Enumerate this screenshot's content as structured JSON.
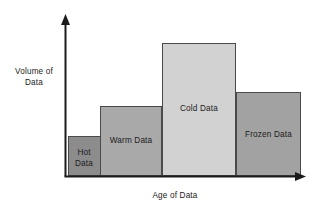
{
  "figure": {
    "background_color": "#ffffff",
    "axis_color": "#1b1b1b",
    "bar_border_color": "#4a4a4a"
  },
  "axes": {
    "y_label": "Volume of\nData",
    "x_label": "Age of Data",
    "y_arrow_icon": "arrow-up-icon",
    "x_arrow_icon": "arrow-right-icon"
  },
  "chart_data": {
    "type": "bar",
    "title": "",
    "subtitle": "",
    "xlabel": "Age of Data",
    "ylabel": "Volume of Data",
    "categories": [
      "Hot Data",
      "Warm Data",
      "Cold Data",
      "Frozen Data"
    ],
    "values": [
      30,
      53,
      100,
      63
    ],
    "bar_widths": [
      32,
      62,
      74,
      65
    ],
    "colors": [
      "#8c8c8c",
      "#a9a9a9",
      "#d2d2d2",
      "#a2a2a2"
    ],
    "grid": false,
    "legend": null,
    "xlim": [
      0,
      237
    ],
    "ylim": [
      0,
      100
    ],
    "tick_labels_x": [],
    "tick_labels_y": [],
    "annotations": [
      {
        "text": "Hot Data",
        "category": "Hot Data"
      },
      {
        "text": "Warm Data",
        "category": "Warm Data"
      },
      {
        "text": "Cold Data",
        "category": "Cold Data"
      },
      {
        "text": "Frozen Data",
        "category": "Frozen Data"
      }
    ]
  },
  "bars": [
    {
      "id": "hot-data",
      "label": "Hot\nData",
      "fill": "#8c8c8c",
      "x": 68,
      "y": 136,
      "width": 32,
      "height": 40,
      "label_left": 68,
      "label_top": 148,
      "label_width": 32
    },
    {
      "id": "warm-data",
      "label": "Warm Data",
      "fill": "#a9a9a9",
      "x": 100,
      "y": 106,
      "width": 62,
      "height": 70,
      "label_left": 100,
      "label_top": 136,
      "label_width": 62
    },
    {
      "id": "cold-data",
      "label": "Cold Data",
      "fill": "#d2d2d2",
      "x": 162,
      "y": 43,
      "width": 74,
      "height": 133,
      "label_left": 162,
      "label_top": 104,
      "label_width": 74
    },
    {
      "id": "frozen-data",
      "label": "Frozen Data",
      "fill": "#a2a2a2",
      "x": 236,
      "y": 92,
      "width": 65,
      "height": 84,
      "label_left": 236,
      "label_top": 130,
      "label_width": 65
    }
  ]
}
